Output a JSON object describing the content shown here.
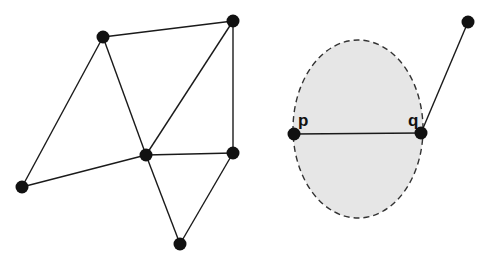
{
  "left_graph": {
    "nodes": [
      {
        "id": "n1",
        "x": 103,
        "y": 37
      },
      {
        "id": "n2",
        "x": 233,
        "y": 21
      },
      {
        "id": "n3",
        "x": 146,
        "y": 155
      },
      {
        "id": "n4",
        "x": 233,
        "y": 153
      },
      {
        "id": "n5",
        "x": 22,
        "y": 187
      },
      {
        "id": "n6",
        "x": 180,
        "y": 244
      }
    ],
    "edges": [
      [
        "n1",
        "n2"
      ],
      [
        "n1",
        "n5"
      ],
      [
        "n1",
        "n3"
      ],
      [
        "n2",
        "n3"
      ],
      [
        "n2",
        "n4"
      ],
      [
        "n3",
        "n4"
      ],
      [
        "n3",
        "n5"
      ],
      [
        "n3",
        "n6"
      ],
      [
        "n4",
        "n6"
      ]
    ]
  },
  "right_figure": {
    "circle": {
      "cx": 358,
      "cy": 129,
      "rx": 65,
      "ry": 89,
      "fill": "#e6e6e6",
      "stroke": "#333333",
      "dashed": true
    },
    "nodes": [
      {
        "id": "p",
        "label": "p",
        "x": 294,
        "y": 134
      },
      {
        "id": "q",
        "label": "q",
        "x": 421,
        "y": 133
      },
      {
        "id": "r",
        "label": "",
        "x": 468,
        "y": 22
      }
    ],
    "edges": [
      [
        "p",
        "q"
      ],
      [
        "q",
        "r"
      ]
    ],
    "labels": {
      "p": "p",
      "q": "q"
    }
  },
  "colors": {
    "node": "#111111",
    "edge": "#1a1a1a",
    "disk_fill": "#e6e6e6"
  }
}
